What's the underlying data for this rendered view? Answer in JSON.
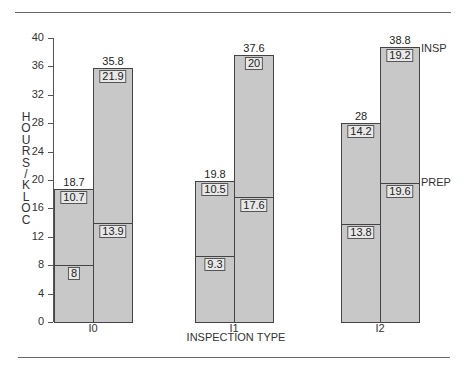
{
  "chart_data": {
    "type": "bar",
    "stacked": true,
    "title": "",
    "xlabel": "INSPECTION TYPE",
    "ylabel": "HOURS/KLOC",
    "ylim": [
      0,
      40
    ],
    "yticks": [
      0,
      4,
      8,
      12,
      16,
      20,
      24,
      28,
      32,
      36,
      40
    ],
    "grid": false,
    "categories": [
      "I0",
      "I1",
      "I2"
    ],
    "groups": [
      {
        "category": "I0",
        "bars": [
          {
            "prep": 8,
            "insp": 10.7,
            "total": 18.7
          },
          {
            "prep": 13.9,
            "insp": 21.9,
            "total": 35.8
          }
        ]
      },
      {
        "category": "I1",
        "bars": [
          {
            "prep": 9.3,
            "insp": 10.5,
            "total": 19.8
          },
          {
            "prep": 17.6,
            "insp": 20,
            "total": 37.6
          }
        ]
      },
      {
        "category": "I2",
        "bars": [
          {
            "prep": 13.8,
            "insp": 14.2,
            "total": 28
          },
          {
            "prep": 19.6,
            "insp": 19.2,
            "total": 38.8
          }
        ]
      }
    ],
    "series": [
      {
        "name": "PREP",
        "values": [
          [
            8,
            13.9
          ],
          [
            9.3,
            17.6
          ],
          [
            13.8,
            19.6
          ]
        ]
      },
      {
        "name": "INSP",
        "values": [
          [
            10.7,
            21.9
          ],
          [
            10.5,
            20
          ],
          [
            14.2,
            19.2
          ]
        ]
      }
    ],
    "legend": {
      "position": "right-inline",
      "entries": [
        "INSP",
        "PREP"
      ]
    }
  },
  "labels": {
    "ylabel_letters": [
      "H",
      "O",
      "U",
      "R",
      "S",
      "/",
      "K",
      "L",
      "O",
      "C"
    ],
    "xtitle": "INSPECTION TYPE",
    "legend_insp": "INSP",
    "legend_prep": "PREP"
  }
}
